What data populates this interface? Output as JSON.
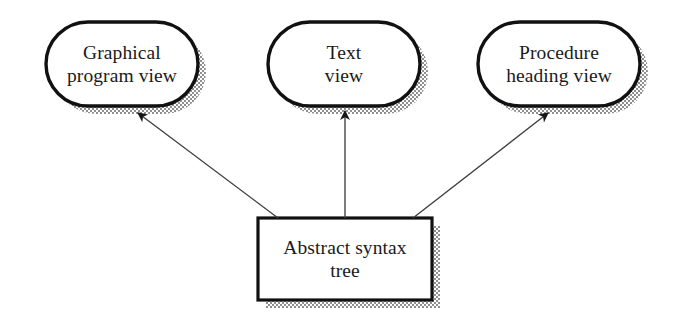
{
  "diagram": {
    "type": "data-flow-diagram",
    "colors": {
      "outline": "#111111",
      "fill": "#ffffff",
      "shadow": "#9a9a9a",
      "arrow": "#3a3a3a",
      "text": "#1a1a1a",
      "background": "#ffffff"
    },
    "style": {
      "shadow_offset_px": 8,
      "node_outline_width_px": 3,
      "rect_outline_width_px": 3,
      "arrow_line_width_px": 1.3,
      "shadow_pattern": "halftone-checkerboard"
    },
    "nodes": [
      {
        "id": "graphical-program-view",
        "shape": "stadium",
        "label": "Graphical\nprogram view",
        "line1": "Graphical",
        "line2": "program view",
        "x": 46,
        "y": 22,
        "width": 152,
        "height": 84
      },
      {
        "id": "text-view",
        "shape": "stadium",
        "label": "Text\nview",
        "line1": "Text",
        "line2": "view",
        "x": 268,
        "y": 22,
        "width": 152,
        "height": 84
      },
      {
        "id": "procedure-heading-view",
        "shape": "stadium",
        "label": "Procedure\nheading view",
        "line1": "Procedure",
        "line2": "heading view",
        "x": 478,
        "y": 22,
        "width": 162,
        "height": 84
      },
      {
        "id": "abstract-syntax-tree",
        "shape": "rectangle",
        "label": "Abstract syntax\ntree",
        "line1": "Abstract syntax",
        "line2": "tree",
        "x": 258,
        "y": 218,
        "width": 174,
        "height": 82
      }
    ],
    "edges": [
      {
        "id": "edge-to-graphical-program-view",
        "from": "abstract-syntax-tree",
        "to": "graphical-program-view",
        "direction": "up-left",
        "arrowhead": "barbed",
        "tail_x": 278,
        "tail_y": 218,
        "head_x": 136,
        "head_y": 112
      },
      {
        "id": "edge-to-text-view",
        "from": "abstract-syntax-tree",
        "to": "text-view",
        "direction": "up",
        "arrowhead": "barbed",
        "tail_x": 345,
        "tail_y": 218,
        "head_x": 345,
        "head_y": 110
      },
      {
        "id": "edge-to-procedure-heading-view",
        "from": "abstract-syntax-tree",
        "to": "procedure-heading-view",
        "direction": "up-right",
        "arrowhead": "barbed",
        "tail_x": 413,
        "tail_y": 218,
        "head_x": 549,
        "head_y": 112
      }
    ]
  }
}
